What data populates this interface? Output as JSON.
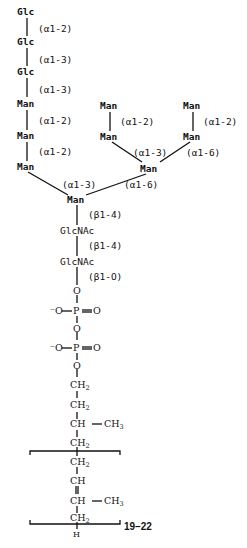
{
  "residues": {
    "glc1": "Glc",
    "glc2": "Glc",
    "glc3": "Glc",
    "man_a1": "Man",
    "man_a2": "Man",
    "man_a3": "Man",
    "man_b1": "Man",
    "man_b2": "Man",
    "man_c1": "Man",
    "man_c2": "Man",
    "man_branch": "Man",
    "man_core": "Man",
    "glcnac1": "GlcNAc",
    "glcnac2": "GlcNAc"
  },
  "linkages": {
    "glc1_glc2": "(α1-2)",
    "glc2_glc3": "(α1-3)",
    "glc3_man": "(α1-3)",
    "man_a1_a2": "(α1-2)",
    "man_a2_a3": "(α1-2)",
    "man_b": "(α1-2)",
    "man_c": "(α1-2)",
    "branch_left": "(α1-3)",
    "branch_right": "(α1-6)",
    "core_left": "(α1-3)",
    "core_right": "(α1-6)",
    "core_glcnac": "(β1-4)",
    "glcnac_glcnac": "(β1-4)",
    "glcnac_o": "(β1-O)"
  },
  "phosphate": {
    "o1": "O",
    "o_minus1": "⁻O",
    "p1": "P",
    "o_eq1": "O",
    "o2": "O",
    "o_minus2": "⁻O",
    "p2": "P",
    "o_eq2": "O",
    "o3": "O"
  },
  "dolichol": {
    "ch2_a": "CH",
    "ch2_b": "CH",
    "ch_c": "CH",
    "ch3_c": "CH",
    "ch2_d": "CH",
    "ch2_e": "CH",
    "ch_f": "CH",
    "ch_g": "CH",
    "ch3_g": "CH",
    "ch2_h": "CH",
    "h_end": "H",
    "sub2": "2",
    "sub3": "3",
    "repeat_count": "19–22"
  }
}
